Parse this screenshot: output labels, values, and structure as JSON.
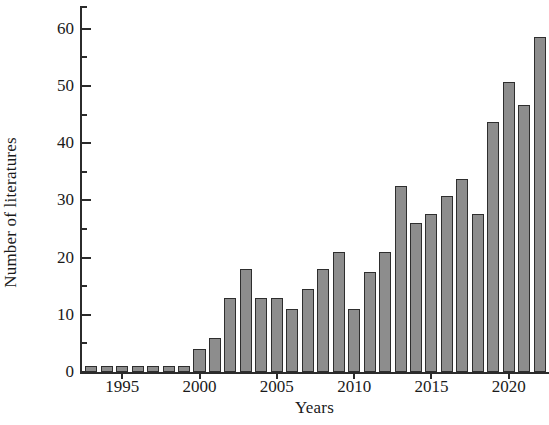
{
  "chart_data": {
    "type": "bar",
    "title": "",
    "xlabel": "Years",
    "ylabel": "Number of literatures",
    "categories": [
      1993,
      1994,
      1995,
      1996,
      1997,
      1998,
      1999,
      2000,
      2001,
      2002,
      2003,
      2004,
      2005,
      2006,
      2007,
      2008,
      2009,
      2010,
      2011,
      2012,
      2013,
      2014,
      2015,
      2016,
      2017,
      2018,
      2019,
      2020,
      2021,
      2022
    ],
    "values": [
      1,
      1,
      1,
      1,
      1,
      1,
      1,
      4,
      6,
      13,
      18,
      13,
      13,
      11,
      14.5,
      18,
      21,
      11,
      17.5,
      21,
      32.6,
      26,
      27.6,
      30.8,
      33.8,
      27.6,
      43.8,
      50.8,
      46.7,
      58.6
    ],
    "xlim": [
      1992.4,
      2022.6
    ],
    "ylim": [
      0,
      64
    ],
    "y_major_ticks": [
      0,
      10,
      20,
      30,
      40,
      50,
      60
    ],
    "y_minor_ticks": [
      5,
      15,
      25,
      35,
      45,
      55
    ],
    "y_tick_labels": [
      "0",
      "10",
      "20",
      "30",
      "40",
      "50",
      "60"
    ],
    "x_tick_values": [
      1995,
      2000,
      2005,
      2010,
      2015,
      2020
    ],
    "x_tick_labels": [
      "1995",
      "2000",
      "2005",
      "2010",
      "2015",
      "2020"
    ],
    "grid": false,
    "legend": null,
    "bar_fill_color": "#8d8d8d",
    "bar_edge_color": "#2e2e2e",
    "axis_color": "#2b2b2b",
    "background_color": "#ffffff"
  }
}
